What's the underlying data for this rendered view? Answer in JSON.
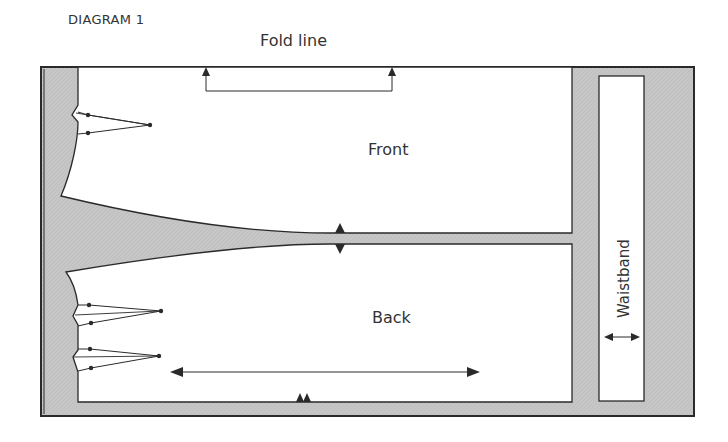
{
  "title": "DIAGRAM 1",
  "labels": {
    "fold_line": "Fold line",
    "front": "Front",
    "back": "Back",
    "waistband": "Waistband"
  },
  "colors": {
    "fabric": "#c4c4c4",
    "outline": "#2a2a2a",
    "pattern_piece": "#ffffff",
    "text": "#333333"
  },
  "pieces": [
    {
      "name": "Front",
      "darts": 1
    },
    {
      "name": "Back",
      "darts": 2
    },
    {
      "name": "Waistband",
      "darts": 0
    }
  ],
  "markings": {
    "fold_line_arrows": 2,
    "center_notch": "double triangle",
    "back_bottom_notch": "double notch",
    "grainline_back": "horizontal double-headed arrow",
    "grainline_waistband": "horizontal double-headed arrow"
  }
}
